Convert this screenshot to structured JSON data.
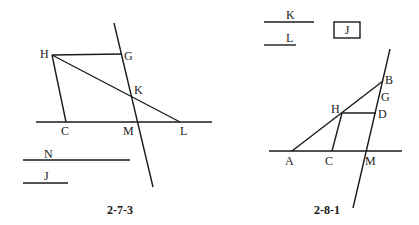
{
  "figures": [
    {
      "caption": "2-7-3",
      "points": {
        "H": "H",
        "G": "G",
        "K": "K",
        "C": "C",
        "M": "M",
        "L": "L"
      },
      "segments": {
        "N": "N",
        "J": "J"
      }
    },
    {
      "caption": "2-8-1",
      "points": {
        "B": "B",
        "G": "G",
        "H": "H",
        "D": "D",
        "A": "A",
        "C": "C",
        "M": "M"
      },
      "segments": {
        "K": "K",
        "L": "L"
      },
      "boxed_label": "J"
    }
  ],
  "colors": {
    "ink": "#1a1a1a",
    "background": "#ffffff"
  }
}
